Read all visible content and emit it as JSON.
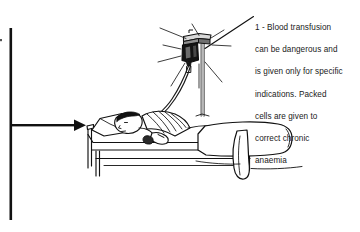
{
  "figure": {
    "background_color": "#ffffff",
    "ink_color": "#000000",
    "text_color": "#1a1a1a"
  },
  "callout": {
    "marker": "1",
    "separator": "-",
    "full_text": "1 - Blood transfusion can be dangerous and is given only for specific indications. Packed cells are given to correct chronic anaemia",
    "lines": [
      "1 - Blood transfusion",
      "can be dangerous and",
      "is given only for specific",
      "indications. Packed",
      "cells are given to",
      "correct chronic",
      "anaemia"
    ],
    "line_1": "1 - Blood transfusion",
    "line_2": "can be dangerous and",
    "line_3": "is given only for specific",
    "line_4": "indications. Packed",
    "line_5": "cells are given to",
    "line_6": "correct chronic",
    "line_7": "anaemia"
  },
  "elements": {
    "left_rule_label": "left-margin-rule",
    "pointer_arrow_label": "left-pointer-arrow",
    "leader_line_label": "callout-leader-line",
    "iv_bag_label": "iv-blood-bag",
    "iv_stand_label": "iv-drip-stand",
    "iv_tube_label": "iv-tubing",
    "patient_label": "patient-in-bed",
    "bed_label": "hospital-bed",
    "blanket_label": "bed-blanket",
    "pillow_label": "pillow",
    "shine_label": "bag-shine-rays"
  }
}
